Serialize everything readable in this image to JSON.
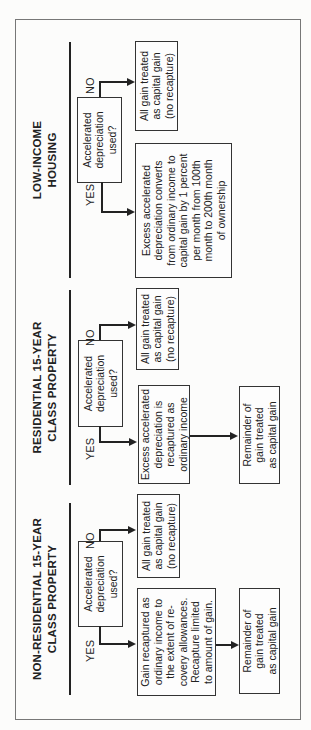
{
  "sections": [
    {
      "heading": "LOW-INCOME\nHOUSING",
      "question": "Accelerated\ndepreciation\nused?",
      "no_label": "NO",
      "yes_label": "YES",
      "no_result": "All gain treated\nas capital gain\n(no recapture)",
      "yes_result": "Excess accelerated\ndepreciation converts\nfrom ordinary income to\ncapital gain by 1 percent\nper month from 100th\nmonth to 200th month\nof ownership"
    },
    {
      "heading": "RESIDENTIAL 15-YEAR\nCLASS PROPERTY",
      "question": "Accelerated\ndepreciation\nused?",
      "no_label": "NO",
      "yes_label": "YES",
      "no_result": "All gain treated\nas capital gain\n(no recapture)",
      "yes_result": "Excess accelerated\ndepreciation is\nrecaptured as\nordinary income",
      "remainder": "Remainder of\ngain treated\nas capital gain"
    },
    {
      "heading": "NON-RESIDENTIAL 15-YEAR\nCLASS PROPERTY",
      "question": "Accelerated\ndepreciation\nused?",
      "no_label": "NO",
      "yes_label": "YES",
      "no_result": "All gain treated\nas capital gain\n(no recapture)",
      "yes_result": "Gain recaptured as\nordinary income to\nthe extent of re-\ncovery allowances.\nRecapture limited\nto amount of gain.",
      "remainder": "Remainder of\ngain treated\nas capital gain"
    }
  ],
  "orientation": "rotated 90° counter-clockwise"
}
